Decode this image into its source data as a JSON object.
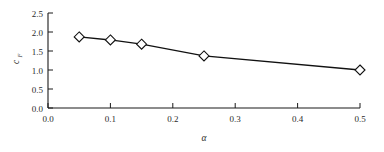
{
  "chart_data": {
    "type": "line",
    "title": "",
    "subtitle": "",
    "xlabel": "α",
    "ylabel": "c",
    "ylabel_sub": "F",
    "xlim": [
      0.0,
      0.5
    ],
    "ylim": [
      0.0,
      2.5
    ],
    "xticks": [
      0.0,
      0.1,
      0.2,
      0.3,
      0.4,
      0.5
    ],
    "yticks": [
      0.0,
      0.5,
      1.0,
      1.5,
      2.0,
      2.5
    ],
    "xtick_labels": [
      "0.0",
      "0.1",
      "0.2",
      "0.3",
      "0.4",
      "0.5"
    ],
    "ytick_labels": [
      "0.0",
      "0.5",
      "1.0",
      "1.5",
      "2.0",
      "2.5"
    ],
    "grid": false,
    "legend": false,
    "legend_position": "none",
    "marker": "open-diamond",
    "line_color": "#111111",
    "marker_fill": "#ffffff",
    "marker_edge": "#111111",
    "series": [
      {
        "name": "cF",
        "x": [
          0.05,
          0.1,
          0.15,
          0.25,
          0.5
        ],
        "values": [
          1.87,
          1.79,
          1.68,
          1.37,
          1.0
        ]
      }
    ],
    "annotations": []
  },
  "axes_geometry": {
    "left_px": 48,
    "right_px": 360,
    "top_px": 13,
    "bottom_px": 108
  }
}
